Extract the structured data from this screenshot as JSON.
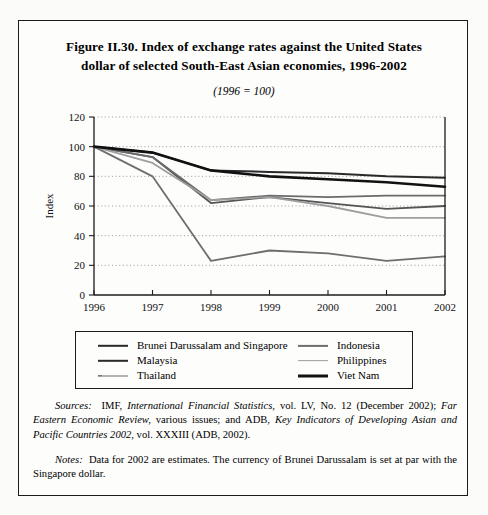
{
  "figure": {
    "title_line_1": "Figure II.30.  Index of exchange rates against the United States",
    "title_line_2": "dollar of selected South-East Asian economies, 1996-2002",
    "subtitle": "(1996 = 100)"
  },
  "sources": {
    "label": "Sources:",
    "text_1": "IMF,",
    "italic_1": "International Financial Statistics,",
    "text_2": "vol. LV, No. 12 (December 2002);",
    "italic_2": "Far Eastern Economic Review,",
    "text_3": "various issues; and ADB,",
    "italic_3": "Key Indicators of Developing Asian and Pacific Countries 2002,",
    "text_4": "vol. XXXIII (ADB, 2002)."
  },
  "notes": {
    "label": "Notes:",
    "text": "Data for 2002 are estimates.  The currency of Brunei Darussalam is set at par with the Singapore dollar."
  },
  "legend": {
    "left_column": [
      {
        "label": "Brunei Darussalam and Singapore",
        "color": "#2a2a2a",
        "width": 2.4,
        "dash": "none"
      },
      {
        "label": "Malaysia",
        "color": "#2a2a2a",
        "width": 2.4,
        "dash": "none"
      },
      {
        "label": "Thailand",
        "color": "#6b6b6b",
        "width": 1.6,
        "dash": "dotted-lead"
      }
    ],
    "right_column": [
      {
        "label": "Indonesia",
        "color": "#6e6e6e",
        "width": 2.2,
        "dash": "none"
      },
      {
        "label": "Philippines",
        "color": "#9e9e9e",
        "width": 1.8,
        "dash": "none"
      },
      {
        "label": "Viet Nam",
        "color": "#111111",
        "width": 3.0,
        "dash": "none"
      }
    ]
  },
  "chart_data": {
    "type": "line",
    "title": "Index of exchange rates against the United States dollar of selected South-East Asian economies, 1996-2002",
    "subtitle": "(1996 = 100)",
    "xlabel": "",
    "ylabel": "Index",
    "x": [
      1996,
      1997,
      1998,
      1999,
      2000,
      2001,
      2002
    ],
    "categories": [
      "1996",
      "1997",
      "1998",
      "1999",
      "2000",
      "2001",
      "2002"
    ],
    "ylim": [
      0,
      120
    ],
    "yticks": [
      0,
      20,
      40,
      60,
      80,
      100,
      120
    ],
    "grid": "horizontal-dotted",
    "legend_position": "below-plot",
    "series": [
      {
        "name": "Brunei Darussalam and Singapore",
        "color": "#2a2a2a",
        "width": 2.0,
        "values": [
          100,
          96,
          84,
          83,
          82,
          80,
          79
        ]
      },
      {
        "name": "Malaysia",
        "color": "#555555",
        "width": 1.8,
        "values": [
          100,
          93,
          62,
          66,
          62,
          58,
          60
        ]
      },
      {
        "name": "Thailand",
        "color": "#6b6b6b",
        "width": 1.7,
        "values": [
          100,
          93,
          64,
          67,
          66,
          67,
          67
        ]
      },
      {
        "name": "Indonesia",
        "color": "#6e6e6e",
        "width": 1.8,
        "values": [
          100,
          80,
          23,
          30,
          28,
          23,
          26
        ]
      },
      {
        "name": "Philippines",
        "color": "#9e9e9e",
        "width": 1.8,
        "values": [
          100,
          89,
          64,
          66,
          60,
          52,
          52
        ]
      },
      {
        "name": "Viet Nam",
        "color": "#111111",
        "width": 2.6,
        "values": [
          100,
          96,
          84,
          80,
          78,
          76,
          73
        ]
      }
    ]
  }
}
